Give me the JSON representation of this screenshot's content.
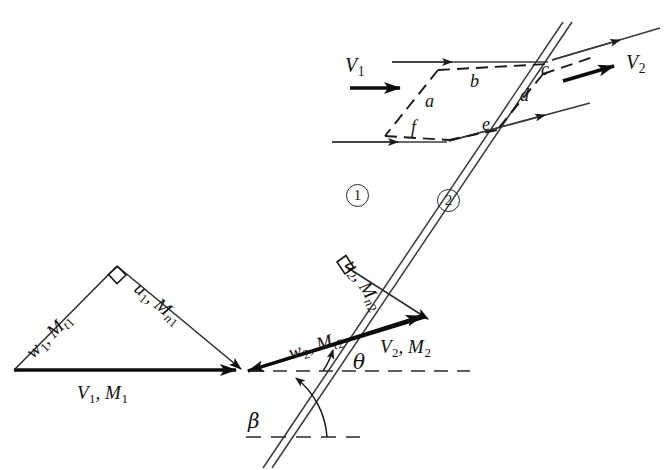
{
  "figure": {
    "background_color": "#ffffff",
    "line_color": "#1a1a1a"
  },
  "shock": {
    "name": "oblique-shock-wave",
    "style": "double-line",
    "angle_label": "β"
  },
  "regions": [
    {
      "id": "region-1",
      "label": "1"
    },
    {
      "id": "region-2",
      "label": "2"
    }
  ],
  "control_volume": {
    "faces": [
      {
        "id": "face-a",
        "label": "a"
      },
      {
        "id": "face-b",
        "label": "b"
      },
      {
        "id": "face-c",
        "label": "c"
      },
      {
        "id": "face-d",
        "label": "d"
      },
      {
        "id": "face-e",
        "label": "e"
      },
      {
        "id": "face-f",
        "label": "f"
      }
    ],
    "upstream_velocity": {
      "symbol": "V",
      "sub": "1"
    },
    "downstream_velocity": {
      "symbol": "V",
      "sub": "2"
    }
  },
  "upstream_triangle": {
    "hypotenuse": {
      "symbol": "V",
      "sub": "1",
      "mach": "M",
      "mach_sub": "1"
    },
    "tangential": {
      "symbol": "w",
      "sub": "1",
      "mach": "M",
      "mach_sub": "t1"
    },
    "normal": {
      "symbol": "u",
      "sub": "1",
      "mach": "M",
      "mach_sub": "n1"
    },
    "right_angle": true
  },
  "downstream_triangle": {
    "hypotenuse": {
      "symbol": "V",
      "sub": "2",
      "mach": "M",
      "mach_sub": "2"
    },
    "tangential": {
      "symbol": "w",
      "sub": "2",
      "mach": "M",
      "mach_sub": "t2"
    },
    "normal": {
      "symbol": "u",
      "sub": "2",
      "mach": "M",
      "mach_sub": "n2"
    },
    "deflection_label": "θ",
    "right_angle": true
  },
  "labels": {
    "V1_M1": "V₁, M₁",
    "w1_Mt1": "w₁, Mₜ₁",
    "u1_Mn1": "u₁, Mₙ₁",
    "V2_M2": "V₂, M₂",
    "w2_Mt2": "w₂, Mₜ₂",
    "u2_Mn2": "u₂, Mₙ₂",
    "V1": "V₁",
    "V2": "V₂",
    "beta": "β",
    "theta": "θ",
    "a": "a",
    "b": "b",
    "c": "c",
    "d": "d",
    "e": "e",
    "f": "f",
    "region1": "1",
    "region2": "2"
  }
}
